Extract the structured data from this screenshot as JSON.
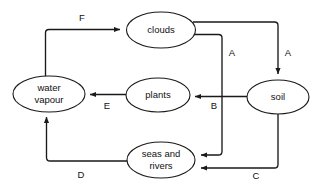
{
  "diagram": {
    "background_color": "#ffffff",
    "stroke_color": "#1a1a1a",
    "text_color": "#111111",
    "nodes": [
      {
        "id": "clouds",
        "label": "clouds",
        "lines": [
          "clouds"
        ],
        "cx": 161,
        "cy": 30,
        "rx": 34.5,
        "ry": 18
      },
      {
        "id": "water-vapour",
        "label": "water vapour",
        "lines": [
          "water",
          "vapour"
        ],
        "cx": 49,
        "cy": 94,
        "rx": 36,
        "ry": 18
      },
      {
        "id": "plants",
        "label": "plants",
        "lines": [
          "plants"
        ],
        "cx": 158,
        "cy": 95,
        "rx": 32,
        "ry": 17
      },
      {
        "id": "soil",
        "label": "soil",
        "lines": [
          "soil"
        ],
        "cx": 278,
        "cy": 97,
        "rx": 31,
        "ry": 17
      },
      {
        "id": "seas-and-rivers",
        "label": "seas and rivers",
        "lines": [
          "seas and",
          "rivers"
        ],
        "cx": 161,
        "cy": 160,
        "rx": 34,
        "ry": 18
      }
    ],
    "edges": [
      {
        "id": "edge-f",
        "label": "F",
        "from": "water-vapour",
        "to": "clouds",
        "label_x": 82,
        "label_y": 18
      },
      {
        "id": "edge-a-right",
        "label": "A",
        "from": "clouds",
        "to": "soil",
        "label_x": 288,
        "label_y": 53
      },
      {
        "id": "edge-a-left",
        "label": "A",
        "from": "clouds",
        "to": "seas-and-rivers",
        "label_x": 232,
        "label_y": 53
      },
      {
        "id": "edge-b",
        "label": "B",
        "from": "soil",
        "to": "plants",
        "label_x": 214,
        "label_y": 106
      },
      {
        "id": "edge-c",
        "label": "C",
        "from": "soil",
        "to": "seas-and-rivers",
        "label_x": 256,
        "label_y": 176
      },
      {
        "id": "edge-d",
        "label": "D",
        "from": "seas-and-rivers",
        "to": "water-vapour",
        "label_x": 81,
        "label_y": 175
      },
      {
        "id": "edge-e",
        "label": "E",
        "from": "plants",
        "to": "water-vapour",
        "label_x": 107,
        "label_y": 106
      }
    ]
  }
}
